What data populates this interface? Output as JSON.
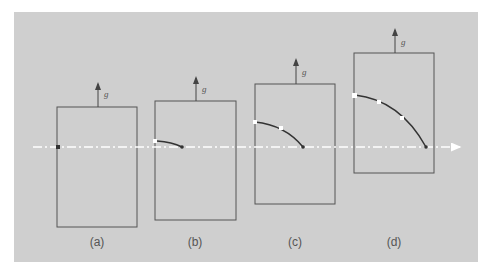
{
  "figure": {
    "gravity_label": "g",
    "panels": [
      {
        "label": "(a)",
        "box": [
          57,
          107,
          80,
          120
        ],
        "arrow_x": 98
      },
      {
        "label": "(b)",
        "box": [
          155,
          101,
          81,
          119
        ],
        "arrow_x": 196
      },
      {
        "label": "(c)",
        "box": [
          255,
          84,
          80,
          120
        ],
        "arrow_x": 296
      },
      {
        "label": "(d)",
        "box": [
          354,
          53,
          80,
          120
        ],
        "arrow_x": 395
      }
    ],
    "colors": {
      "background": "#cfcfcf",
      "box": "#555555",
      "beam": "#ffffff",
      "path": "#333333"
    }
  }
}
